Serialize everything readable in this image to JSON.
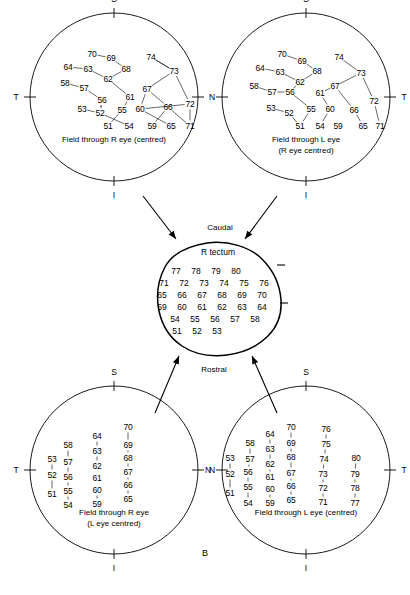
{
  "figure": {
    "panel_letter": "B",
    "arrow_labels": {
      "caudal": "Caudal",
      "rostral": "Rostral"
    },
    "axis_labels": {
      "superior": "S",
      "inferior": "I",
      "temporal": "T",
      "nasal": "N"
    }
  },
  "tectum": {
    "title": "R tectum",
    "rows": [
      {
        "y": 271,
        "x": 176,
        "cells": [
          "77",
          "78",
          "79",
          "80"
        ]
      },
      {
        "y": 283,
        "x": 164,
        "cells": [
          "71",
          "72",
          "73",
          "74",
          "75",
          "76"
        ]
      },
      {
        "y": 295,
        "x": 162,
        "cells": [
          "65",
          "66",
          "67",
          "68",
          "69",
          "70"
        ]
      },
      {
        "y": 307,
        "x": 162,
        "cells": [
          "59",
          "60",
          "61",
          "62",
          "63",
          "64"
        ]
      },
      {
        "y": 319,
        "x": 175,
        "cells": [
          "54",
          "55",
          "56",
          "57",
          "58"
        ]
      },
      {
        "y": 331,
        "x": 177,
        "cells": [
          "51",
          "52",
          "53"
        ]
      }
    ]
  },
  "circles": [
    {
      "id": "top-left",
      "caption_lines": [
        "Field through  R eye (centred)"
      ],
      "left_axis": "T",
      "right_axis": "N",
      "points": [
        {
          "v": "70",
          "x": 62,
          "y": 41
        },
        {
          "v": "69",
          "x": 81,
          "y": 45
        },
        {
          "v": "74",
          "x": 121,
          "y": 44
        },
        {
          "v": "64",
          "x": 38,
          "y": 54
        },
        {
          "v": "63",
          "x": 58,
          "y": 56
        },
        {
          "v": "68",
          "x": 96,
          "y": 56
        },
        {
          "v": "73",
          "x": 144,
          "y": 58
        },
        {
          "v": "58",
          "x": 35,
          "y": 70
        },
        {
          "v": "57",
          "x": 54,
          "y": 75
        },
        {
          "v": "62",
          "x": 78,
          "y": 66
        },
        {
          "v": "67",
          "x": 117,
          "y": 76
        },
        {
          "v": "56",
          "x": 72,
          "y": 87
        },
        {
          "v": "61",
          "x": 100,
          "y": 84
        },
        {
          "v": "72",
          "x": 160,
          "y": 91
        },
        {
          "v": "53",
          "x": 52,
          "y": 96
        },
        {
          "v": "52",
          "x": 70,
          "y": 100
        },
        {
          "v": "55",
          "x": 92,
          "y": 97
        },
        {
          "v": "60",
          "x": 110,
          "y": 96
        },
        {
          "v": "66",
          "x": 138,
          "y": 94
        },
        {
          "v": "51",
          "x": 78,
          "y": 113
        },
        {
          "v": "54",
          "x": 99,
          "y": 113
        },
        {
          "v": "59",
          "x": 122,
          "y": 113
        },
        {
          "v": "65",
          "x": 141,
          "y": 113
        },
        {
          "v": "71",
          "x": 160,
          "y": 113
        }
      ],
      "links": [
        [
          0,
          1
        ],
        [
          1,
          5
        ],
        [
          5,
          9
        ],
        [
          9,
          12
        ],
        [
          12,
          16
        ],
        [
          16,
          19
        ],
        [
          3,
          4
        ],
        [
          4,
          9
        ],
        [
          2,
          6
        ],
        [
          6,
          10
        ],
        [
          10,
          18
        ],
        [
          18,
          21
        ],
        [
          7,
          8
        ],
        [
          8,
          11
        ],
        [
          11,
          15
        ],
        [
          15,
          20
        ],
        [
          14,
          15
        ],
        [
          15,
          11
        ],
        [
          13,
          17
        ],
        [
          17,
          22
        ],
        [
          6,
          13
        ],
        [
          10,
          17
        ],
        [
          2,
          6
        ],
        [
          23,
          13
        ],
        [
          23,
          18
        ]
      ]
    },
    {
      "id": "top-right",
      "caption_lines": [
        "Field through L eye",
        "(R eye centred)"
      ],
      "left_axis": "",
      "right_axis": "T",
      "points": [
        {
          "v": "70",
          "x": 60,
          "y": 41
        },
        {
          "v": "69",
          "x": 80,
          "y": 48
        },
        {
          "v": "74",
          "x": 117,
          "y": 44
        },
        {
          "v": "64",
          "x": 38,
          "y": 55
        },
        {
          "v": "63",
          "x": 58,
          "y": 59
        },
        {
          "v": "68",
          "x": 95,
          "y": 58
        },
        {
          "v": "73",
          "x": 139,
          "y": 60
        },
        {
          "v": "58",
          "x": 32,
          "y": 73
        },
        {
          "v": "57",
          "x": 50,
          "y": 79
        },
        {
          "v": "62",
          "x": 78,
          "y": 69
        },
        {
          "v": "67",
          "x": 113,
          "y": 73
        },
        {
          "v": "56",
          "x": 68,
          "y": 79
        },
        {
          "v": "61",
          "x": 98,
          "y": 80
        },
        {
          "v": "72",
          "x": 152,
          "y": 88
        },
        {
          "v": "53",
          "x": 49,
          "y": 95
        },
        {
          "v": "52",
          "x": 67,
          "y": 100
        },
        {
          "v": "55",
          "x": 89,
          "y": 96
        },
        {
          "v": "60",
          "x": 108,
          "y": 96
        },
        {
          "v": "66",
          "x": 132,
          "y": 97
        },
        {
          "v": "51",
          "x": 78,
          "y": 113
        },
        {
          "v": "54",
          "x": 98,
          "y": 113
        },
        {
          "v": "59",
          "x": 116,
          "y": 113
        },
        {
          "v": "65",
          "x": 141,
          "y": 113
        },
        {
          "v": "71",
          "x": 158,
          "y": 113
        }
      ],
      "links": [
        [
          0,
          1
        ],
        [
          1,
          5
        ],
        [
          5,
          9
        ],
        [
          9,
          11
        ],
        [
          11,
          16
        ],
        [
          16,
          19
        ],
        [
          3,
          4
        ],
        [
          4,
          9
        ],
        [
          2,
          6
        ],
        [
          6,
          10
        ],
        [
          10,
          12
        ],
        [
          12,
          17
        ],
        [
          17,
          20
        ],
        [
          7,
          8
        ],
        [
          8,
          11
        ],
        [
          14,
          15
        ],
        [
          15,
          19
        ],
        [
          6,
          13
        ],
        [
          13,
          23
        ],
        [
          10,
          18
        ],
        [
          18,
          22
        ]
      ]
    },
    {
      "id": "bottom-left",
      "caption_lines": [
        "Field through R eye",
        "(L  eye centred)"
      ],
      "left_axis": "T",
      "right_axis": "N",
      "points": [
        {
          "v": "70",
          "x": 98,
          "y": 41
        },
        {
          "v": "64",
          "x": 67,
          "y": 50
        },
        {
          "v": "69",
          "x": 98,
          "y": 59
        },
        {
          "v": "58",
          "x": 38,
          "y": 59
        },
        {
          "v": "63",
          "x": 67,
          "y": 65
        },
        {
          "v": "68",
          "x": 98,
          "y": 72
        },
        {
          "v": "53",
          "x": 22,
          "y": 73
        },
        {
          "v": "57",
          "x": 38,
          "y": 76
        },
        {
          "v": "62",
          "x": 67,
          "y": 80
        },
        {
          "v": "67",
          "x": 98,
          "y": 86
        },
        {
          "v": "52",
          "x": 22,
          "y": 89
        },
        {
          "v": "56",
          "x": 38,
          "y": 91
        },
        {
          "v": "61",
          "x": 67,
          "y": 92
        },
        {
          "v": "66",
          "x": 98,
          "y": 99
        },
        {
          "v": "51",
          "x": 22,
          "y": 108
        },
        {
          "v": "55",
          "x": 38,
          "y": 105
        },
        {
          "v": "60",
          "x": 67,
          "y": 104
        },
        {
          "v": "65",
          "x": 98,
          "y": 113
        },
        {
          "v": "54",
          "x": 38,
          "y": 119
        },
        {
          "v": "59",
          "x": 67,
          "y": 118
        }
      ],
      "links": [
        [
          0,
          2
        ],
        [
          2,
          5
        ],
        [
          5,
          9
        ],
        [
          9,
          13
        ],
        [
          13,
          17
        ],
        [
          1,
          4
        ],
        [
          4,
          8
        ],
        [
          8,
          12
        ],
        [
          12,
          16
        ],
        [
          16,
          19
        ],
        [
          3,
          7
        ],
        [
          7,
          11
        ],
        [
          11,
          15
        ],
        [
          15,
          18
        ],
        [
          6,
          10
        ],
        [
          10,
          14
        ]
      ]
    },
    {
      "id": "bottom-right",
      "caption_lines": [
        "Field through L eye (centred)"
      ],
      "left_axis": "N",
      "right_axis": "T",
      "points": [
        {
          "v": "70",
          "x": 69,
          "y": 41
        },
        {
          "v": "76",
          "x": 104,
          "y": 43
        },
        {
          "v": "64",
          "x": 48,
          "y": 48
        },
        {
          "v": "69",
          "x": 69,
          "y": 57
        },
        {
          "v": "58",
          "x": 28,
          "y": 57
        },
        {
          "v": "75",
          "x": 104,
          "y": 58
        },
        {
          "v": "63",
          "x": 48,
          "y": 63
        },
        {
          "v": "68",
          "x": 69,
          "y": 71
        },
        {
          "v": "53",
          "x": 8,
          "y": 72
        },
        {
          "v": "57",
          "x": 28,
          "y": 73
        },
        {
          "v": "74",
          "x": 102,
          "y": 73
        },
        {
          "v": "80",
          "x": 134,
          "y": 72
        },
        {
          "v": "62",
          "x": 48,
          "y": 78
        },
        {
          "v": "67",
          "x": 69,
          "y": 87
        },
        {
          "v": "52",
          "x": 8,
          "y": 88
        },
        {
          "v": "56",
          "x": 26,
          "y": 86
        },
        {
          "v": "73",
          "x": 101,
          "y": 88
        },
        {
          "v": "79",
          "x": 133,
          "y": 88
        },
        {
          "v": "61",
          "x": 48,
          "y": 91
        },
        {
          "v": "66",
          "x": 69,
          "y": 100
        },
        {
          "v": "51",
          "x": 8,
          "y": 107
        },
        {
          "v": "55",
          "x": 26,
          "y": 101
        },
        {
          "v": "60",
          "x": 48,
          "y": 103
        },
        {
          "v": "72",
          "x": 101,
          "y": 102
        },
        {
          "v": "78",
          "x": 133,
          "y": 102
        },
        {
          "v": "65",
          "x": 69,
          "y": 114
        },
        {
          "v": "54",
          "x": 26,
          "y": 117
        },
        {
          "v": "59",
          "x": 48,
          "y": 117
        },
        {
          "v": "71",
          "x": 101,
          "y": 116
        },
        {
          "v": "77",
          "x": 133,
          "y": 117
        }
      ],
      "links": [
        [
          0,
          3
        ],
        [
          3,
          7
        ],
        [
          7,
          13
        ],
        [
          13,
          19
        ],
        [
          19,
          25
        ],
        [
          2,
          6
        ],
        [
          6,
          12
        ],
        [
          12,
          18
        ],
        [
          18,
          22
        ],
        [
          22,
          27
        ],
        [
          4,
          9
        ],
        [
          9,
          15
        ],
        [
          15,
          21
        ],
        [
          21,
          26
        ],
        [
          8,
          14
        ],
        [
          14,
          20
        ],
        [
          1,
          5
        ],
        [
          5,
          10
        ],
        [
          10,
          16
        ],
        [
          16,
          23
        ],
        [
          23,
          28
        ],
        [
          11,
          17
        ],
        [
          17,
          24
        ],
        [
          24,
          29
        ]
      ]
    }
  ]
}
